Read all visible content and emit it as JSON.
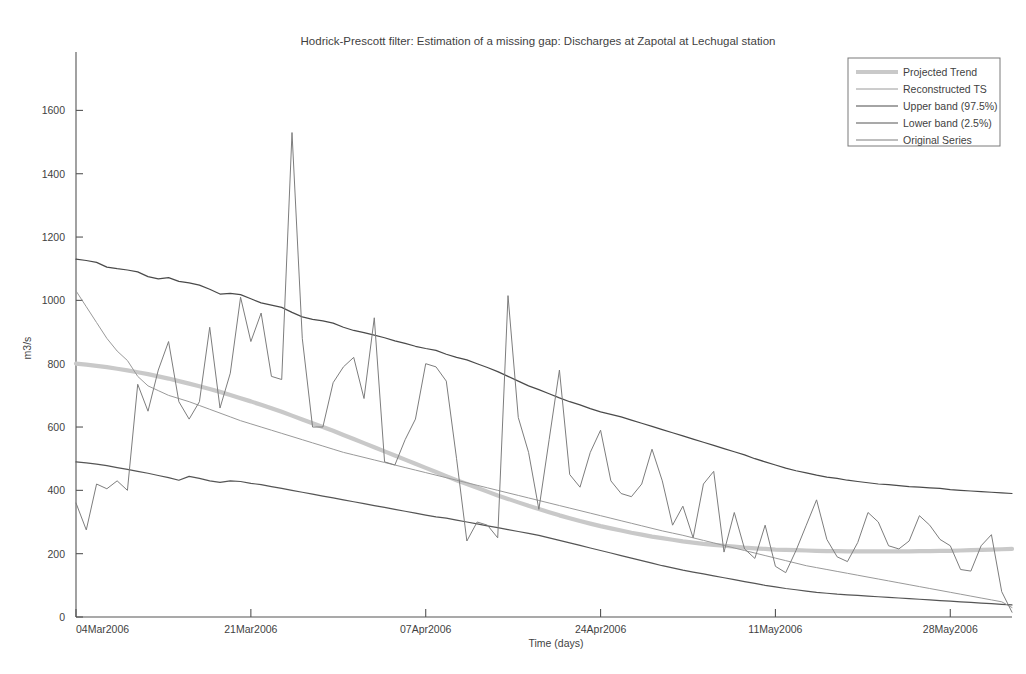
{
  "figure": {
    "title": "Hodrick-Prescott filter: Estimation of a missing gap: Discharges at Zapotal at Lechugal station",
    "background": "#ffffff"
  },
  "axes": {
    "x_label": "Time (days)",
    "y_label": "m3/s",
    "x_ticks": [
      "04Mar2006",
      "21Mar2006",
      "07Apr2006",
      "24Apr2006",
      "11May2006",
      "28May2006"
    ],
    "y_ticks": [
      "0",
      "200",
      "400",
      "600",
      "800",
      "1000",
      "1200",
      "1400",
      "1600"
    ]
  },
  "legend": {
    "position": "top-right",
    "items": [
      {
        "label": "Projected Trend",
        "color": "#c9c9c9",
        "width": 4.2
      },
      {
        "label": "Reconstructed TS",
        "color": "#9a9a9a",
        "width": 1.0
      },
      {
        "label": "Upper band (97.5%)",
        "color": "#4a4a4a",
        "width": 1.2
      },
      {
        "label": "Lower band (2.5%)",
        "color": "#555555",
        "width": 1.2
      },
      {
        "label": "Original Series",
        "color": "#7d7d7d",
        "width": 1.0
      }
    ]
  },
  "chart_data": {
    "type": "line",
    "title": "Hodrick-Prescott filter: Estimation of a missing gap: Discharges at Zapotal at Lechugal station",
    "xlabel": "Time (days)",
    "ylabel": "m3/s",
    "xlim": [
      0,
      91
    ],
    "ylim": [
      0,
      1700
    ],
    "grid": false,
    "legend_position": "top-right",
    "x_tick_values": [
      0,
      17,
      34,
      51,
      68,
      85
    ],
    "x_tick_labels": [
      "04Mar2006",
      "21Mar2006",
      "07Apr2006",
      "24Apr2006",
      "11May2006",
      "28May2006"
    ],
    "y_tick_values": [
      0,
      200,
      400,
      600,
      800,
      1000,
      1200,
      1400,
      1600
    ],
    "series": [
      {
        "name": "Projected Trend",
        "color": "#c9c9c9",
        "width": 4.2,
        "values": [
          800,
          797,
          793,
          789,
          784,
          779,
          773,
          767,
          760,
          753,
          745,
          737,
          729,
          720,
          711,
          701,
          691,
          681,
          670,
          659,
          648,
          636,
          624,
          612,
          600,
          588,
          575,
          562,
          549,
          536,
          523,
          510,
          497,
          484,
          471,
          458,
          445,
          432,
          420,
          408,
          396,
          384,
          373,
          362,
          351,
          341,
          331,
          321,
          312,
          303,
          295,
          287,
          280,
          273,
          266,
          260,
          254,
          249,
          244,
          239,
          235,
          231,
          228,
          225,
          222,
          219,
          217,
          215,
          213,
          212,
          211,
          210,
          209,
          208,
          208,
          207,
          207,
          207,
          207,
          207,
          207,
          207,
          208,
          208,
          209,
          209,
          210,
          211,
          212,
          213,
          214,
          215
        ]
      },
      {
        "name": "Upper band (97.5%)",
        "color": "#4a4a4a",
        "width": 1.2,
        "values": [
          1130,
          1126,
          1120,
          1105,
          1100,
          1096,
          1090,
          1075,
          1068,
          1072,
          1060,
          1055,
          1048,
          1035,
          1020,
          1022,
          1018,
          1005,
          992,
          985,
          978,
          962,
          948,
          940,
          935,
          928,
          915,
          905,
          898,
          890,
          882,
          872,
          864,
          855,
          848,
          842,
          830,
          820,
          812,
          800,
          788,
          775,
          760,
          745,
          730,
          718,
          705,
          692,
          680,
          670,
          658,
          648,
          640,
          632,
          622,
          612,
          602,
          592,
          582,
          572,
          562,
          552,
          542,
          532,
          522,
          512,
          500,
          490,
          480,
          470,
          462,
          455,
          448,
          442,
          438,
          432,
          428,
          424,
          420,
          418,
          415,
          412,
          410,
          408,
          406,
          402,
          400,
          398,
          396,
          394,
          392,
          390
        ]
      },
      {
        "name": "Lower band (2.5%)",
        "color": "#555555",
        "width": 1.2,
        "values": [
          490,
          487,
          483,
          478,
          472,
          466,
          460,
          454,
          447,
          440,
          432,
          444,
          438,
          430,
          425,
          430,
          428,
          422,
          418,
          412,
          406,
          400,
          394,
          388,
          382,
          376,
          370,
          364,
          358,
          352,
          346,
          340,
          334,
          328,
          322,
          316,
          312,
          306,
          300,
          294,
          288,
          282,
          276,
          270,
          264,
          258,
          250,
          242,
          234,
          226,
          218,
          210,
          202,
          194,
          186,
          178,
          170,
          162,
          155,
          148,
          142,
          136,
          130,
          124,
          118,
          112,
          106,
          100,
          95,
          90,
          86,
          82,
          78,
          75,
          72,
          70,
          68,
          66,
          64,
          62,
          60,
          58,
          56,
          54,
          52,
          50,
          48,
          46,
          44,
          42,
          40,
          38
        ]
      },
      {
        "name": "Reconstructed TS",
        "color": "#9a9a9a",
        "width": 1.0,
        "values": [
          1030,
          980,
          930,
          880,
          840,
          810,
          760,
          730,
          715,
          700,
          690,
          680,
          668,
          656,
          644,
          632,
          620,
          610,
          600,
          590,
          580,
          570,
          560,
          550,
          540,
          530,
          520,
          512,
          504,
          496,
          488,
          480,
          472,
          464,
          456,
          448,
          440,
          432,
          424,
          416,
          408,
          400,
          392,
          384,
          376,
          368,
          360,
          352,
          344,
          336,
          328,
          320,
          312,
          304,
          296,
          288,
          280,
          272,
          265,
          258,
          250,
          242,
          234,
          226,
          218,
          210,
          202,
          194,
          186,
          178,
          170,
          162,
          156,
          150,
          144,
          138,
          132,
          126,
          120,
          114,
          108,
          102,
          96,
          90,
          84,
          78,
          72,
          66,
          60,
          54,
          48,
          30
        ]
      },
      {
        "name": "Original Series",
        "color": "#7d7d7d",
        "width": 1.0,
        "values": [
          360,
          275,
          420,
          405,
          430,
          400,
          735,
          650,
          780,
          870,
          680,
          625,
          680,
          915,
          660,
          770,
          1010,
          870,
          960,
          760,
          750,
          1530,
          880,
          600,
          600,
          740,
          790,
          820,
          690,
          945,
          490,
          480,
          560,
          625,
          800,
          790,
          745,
          500,
          240,
          300,
          290,
          250,
          1015,
          630,
          520,
          340,
          560,
          780,
          450,
          410,
          520,
          590,
          430,
          390,
          380,
          420,
          530,
          430,
          290,
          350,
          250,
          420,
          460,
          205,
          330,
          215,
          185,
          290,
          160,
          140,
          210,
          290,
          370,
          245,
          190,
          175,
          235,
          330,
          300,
          225,
          215,
          240,
          320,
          290,
          245,
          225,
          150,
          145,
          225,
          260,
          80,
          15
        ]
      }
    ]
  }
}
